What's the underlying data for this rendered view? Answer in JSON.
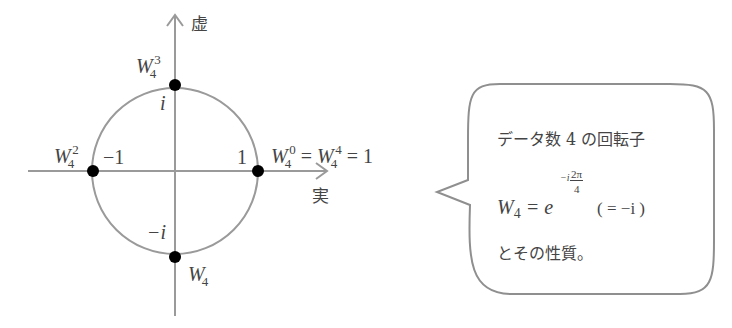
{
  "diagram": {
    "axes": {
      "imag_label": "虚",
      "real_label": "実"
    },
    "points": [
      {
        "name": "W4^3",
        "base": "W",
        "sub": "4",
        "sup": "3",
        "value_label": "i"
      },
      {
        "name": "W4^2",
        "base": "W",
        "sub": "4",
        "sup": "2",
        "value_label": "−1"
      },
      {
        "name": "W4^0 = W4^4 = 1",
        "base": "W",
        "sub": "4",
        "sup": "0",
        "eq1": " = ",
        "base2": "W",
        "sub2": "4",
        "sup2": "4",
        "eq2": " = 1",
        "value_label": "1"
      },
      {
        "name": "W4",
        "base": "W",
        "sub": "4",
        "value_label": "−i"
      }
    ],
    "colors": {
      "line": "#999999",
      "dot": "#000000",
      "text": "#444444"
    }
  },
  "bubble": {
    "line1": "データ数 4 の回転子",
    "formula": {
      "lhs_base": "W",
      "lhs_sub": "4",
      "eq": " = e",
      "exp_prefix": "−i",
      "exp_num": "2π",
      "exp_den": "4",
      "paren": "( = −i )"
    },
    "line3": "とその性質。"
  }
}
